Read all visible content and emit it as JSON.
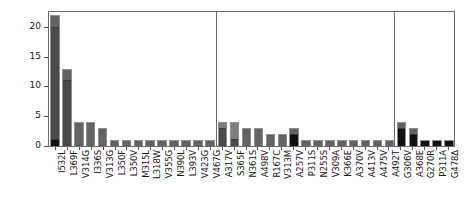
{
  "chart_data": {
    "type": "bar",
    "title": "",
    "subtitle": "",
    "xlabel": "",
    "ylabel": "",
    "ylim": [
      0,
      22.5
    ],
    "yticks": [
      0,
      5,
      10,
      15,
      20
    ],
    "ytick_labels": [
      "0",
      "5",
      "10",
      "15",
      "20"
    ],
    "grid": false,
    "legend": "none",
    "orientation": "vertical",
    "stacked": true,
    "bar_colors": {
      "black": "#111111",
      "dark_gray": "#4a4a4a",
      "mid_gray": "#636363",
      "light_gray": "#7d7d7d",
      "outline": "#8f8f8f"
    },
    "panels": [
      {
        "name": "panel-1",
        "categories": [
          "I532L",
          "L369F",
          "V314G",
          "I336S",
          "V313G",
          "L350F",
          "L350V",
          "M315L",
          "L318W",
          "V355G",
          "N390L",
          "L393V",
          "V423G",
          "V467G"
        ],
        "values": [
          22,
          13,
          4,
          4,
          3,
          1,
          1,
          1,
          1,
          1,
          1,
          1,
          1,
          1
        ],
        "segments": [
          [
            {
              "color": "#111111",
              "value": 1
            },
            {
              "color": "#4a4a4a",
              "value": 19
            },
            {
              "color": "#636363",
              "value": 2
            }
          ],
          [
            {
              "color": "#4a4a4a",
              "value": 11
            },
            {
              "color": "#636363",
              "value": 2
            }
          ],
          [
            {
              "color": "#636363",
              "value": 4
            }
          ],
          [
            {
              "color": "#636363",
              "value": 4
            }
          ],
          [
            {
              "color": "#636363",
              "value": 3
            }
          ],
          [
            {
              "color": "#636363",
              "value": 1
            }
          ],
          [
            {
              "color": "#636363",
              "value": 1
            }
          ],
          [
            {
              "color": "#636363",
              "value": 1
            }
          ],
          [
            {
              "color": "#636363",
              "value": 1
            }
          ],
          [
            {
              "color": "#636363",
              "value": 1
            }
          ],
          [
            {
              "color": "#636363",
              "value": 1
            }
          ],
          [
            {
              "color": "#636363",
              "value": 1
            }
          ],
          [
            {
              "color": "#636363",
              "value": 1
            }
          ],
          [
            {
              "color": "#636363",
              "value": 1
            }
          ]
        ]
      },
      {
        "name": "panel-2",
        "categories": [
          "A317V",
          "S365F",
          "N361S",
          "A498V",
          "R167C",
          "V313M",
          "A257V",
          "P311S",
          "N255S",
          "V309A",
          "K366E",
          "A370V",
          "A413V",
          "A475V",
          "A492T"
        ],
        "values": [
          4,
          4,
          3,
          3,
          2,
          2,
          3,
          1,
          1,
          1,
          1,
          1,
          1,
          1,
          1
        ],
        "segments": [
          [
            {
              "color": "#4a4a4a",
              "value": 3
            },
            {
              "color": "#7d7d7d",
              "value": 1
            }
          ],
          [
            {
              "color": "#4a4a4a",
              "value": 1
            },
            {
              "color": "#7d7d7d",
              "value": 3
            }
          ],
          [
            {
              "color": "#636363",
              "value": 3
            }
          ],
          [
            {
              "color": "#636363",
              "value": 3
            }
          ],
          [
            {
              "color": "#636363",
              "value": 2
            }
          ],
          [
            {
              "color": "#636363",
              "value": 2
            }
          ],
          [
            {
              "color": "#111111",
              "value": 2
            },
            {
              "color": "#636363",
              "value": 1
            }
          ],
          [
            {
              "color": "#636363",
              "value": 1
            }
          ],
          [
            {
              "color": "#636363",
              "value": 1
            }
          ],
          [
            {
              "color": "#636363",
              "value": 1
            }
          ],
          [
            {
              "color": "#636363",
              "value": 1
            }
          ],
          [
            {
              "color": "#636363",
              "value": 1
            }
          ],
          [
            {
              "color": "#636363",
              "value": 1
            }
          ],
          [
            {
              "color": "#636363",
              "value": 1
            }
          ],
          [
            {
              "color": "#636363",
              "value": 1
            }
          ]
        ]
      },
      {
        "name": "panel-3",
        "categories": [
          "G306V",
          "A368E",
          "G270R",
          "P311A",
          "G478Δ"
        ],
        "values": [
          4,
          3,
          1,
          1,
          1
        ],
        "segments": [
          [
            {
              "color": "#111111",
              "value": 3
            },
            {
              "color": "#636363",
              "value": 1
            }
          ],
          [
            {
              "color": "#111111",
              "value": 2
            },
            {
              "color": "#636363",
              "value": 1
            }
          ],
          [
            {
              "color": "#111111",
              "value": 1
            }
          ],
          [
            {
              "color": "#111111",
              "value": 1
            }
          ],
          [
            {
              "color": "#111111",
              "value": 1
            }
          ]
        ]
      }
    ]
  }
}
